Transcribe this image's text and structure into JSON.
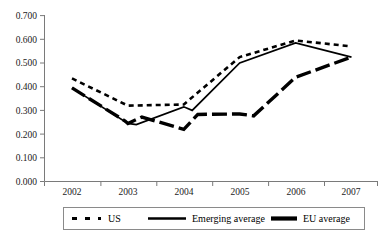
{
  "chart_data": {
    "type": "line",
    "title": "",
    "subtitle": "",
    "xlabel": "",
    "ylabel": "",
    "categories": [
      "2002",
      "2003",
      "2004",
      "2005",
      "2006",
      "2007"
    ],
    "x": [
      2002,
      2003,
      2004,
      2005,
      2006,
      2007
    ],
    "ylim": [
      0.0,
      0.7
    ],
    "ytick_labels": [
      "0.000",
      "0.100",
      "0.200",
      "0.300",
      "0.400",
      "0.500",
      "0.600",
      "0.700"
    ],
    "ytick_values": [
      0.0,
      0.1,
      0.2,
      0.3,
      0.4,
      0.5,
      0.6,
      0.7
    ],
    "grid": false,
    "legend_position": "bottom",
    "series": [
      {
        "name": "US",
        "style": "dotted",
        "color": "#000000",
        "values": [
          0.435,
          0.32,
          0.325,
          0.525,
          0.595,
          0.57
        ]
      },
      {
        "name": "Emerging average",
        "style": "solid",
        "color": "#000000",
        "values": [
          0.395,
          0.245,
          0.315,
          0.5,
          0.585,
          0.525
        ]
      },
      {
        "name": "EU average",
        "style": "thick-dashed",
        "color": "#000000",
        "values": [
          0.395,
          0.245,
          0.22,
          0.285,
          0.44,
          0.525
        ]
      }
    ],
    "series_extra_points": {
      "Emerging average": [
        {
          "x": 2003.15,
          "y": 0.24
        },
        {
          "x": 2004.15,
          "y": 0.3
        }
      ],
      "EU average": [
        {
          "x": 2002.95,
          "y": 0.255
        },
        {
          "x": 2003.25,
          "y": 0.272
        },
        {
          "x": 2004.25,
          "y": 0.283
        },
        {
          "x": 2005.25,
          "y": 0.277
        }
      ]
    }
  },
  "legend": {
    "items": [
      {
        "label": "US",
        "marker": "dotted-line-swatch"
      },
      {
        "label": "Emerging average",
        "marker": "solid-line-swatch"
      },
      {
        "label": "EU average",
        "marker": "thick-line-swatch"
      }
    ]
  },
  "axes": {
    "y_axis_name": "value-axis",
    "x_axis_name": "year-axis"
  }
}
